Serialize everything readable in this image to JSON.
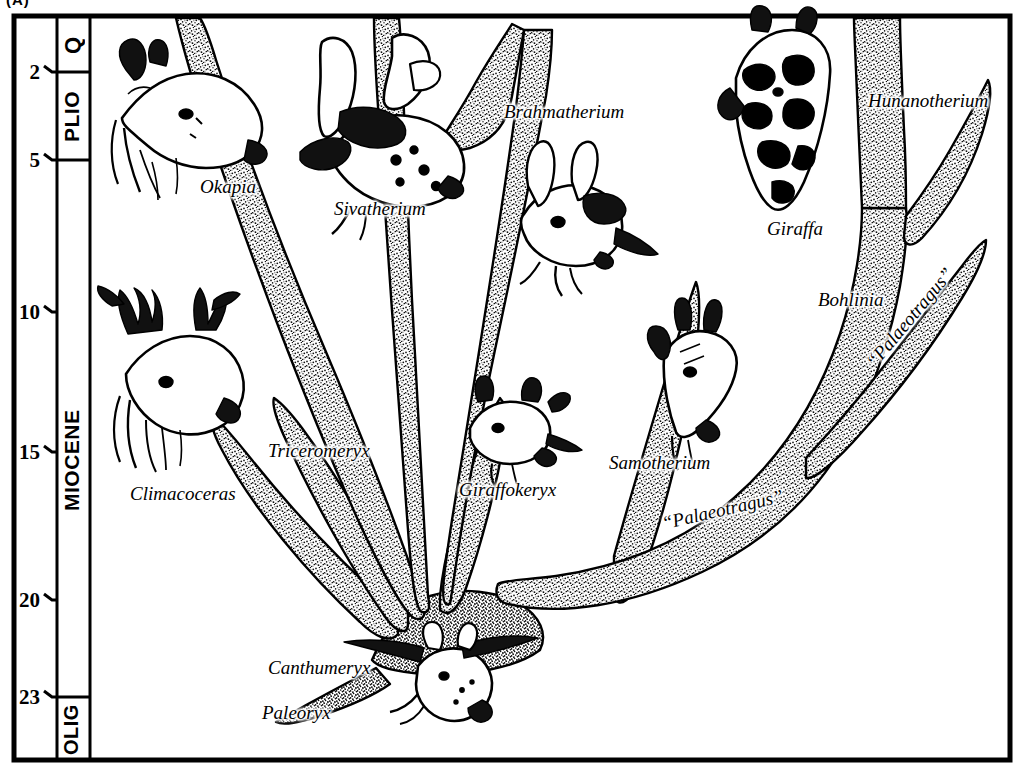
{
  "figure": {
    "caption": "(A)",
    "kind": "phylogenetic-tree"
  },
  "time_scale": {
    "axis_unit": "Ma",
    "ticks": [
      {
        "label": "2",
        "value": 2
      },
      {
        "label": "5",
        "value": 5
      },
      {
        "label": "10",
        "value": 10
      },
      {
        "label": "15",
        "value": 15
      },
      {
        "label": "20",
        "value": 20
      },
      {
        "label": "23",
        "value": 23
      }
    ],
    "epochs": [
      {
        "label": "Q",
        "from": 0,
        "to": 2
      },
      {
        "label": "PLIO",
        "from": 2,
        "to": 5
      },
      {
        "label": "MIOCENE",
        "from": 5,
        "to": 23
      },
      {
        "label": "OLIG",
        "from": 23,
        "to": 26
      }
    ]
  },
  "taxa": [
    {
      "name": "Okapia",
      "quoted": false
    },
    {
      "name": "Sivatherium",
      "quoted": false
    },
    {
      "name": "Brahmatherium",
      "quoted": false
    },
    {
      "name": "Hunanotherium",
      "quoted": false
    },
    {
      "name": "Giraffa",
      "quoted": false
    },
    {
      "name": "Bohlinia",
      "quoted": false
    },
    {
      "name": "“Palaeotragus”",
      "quoted": true
    },
    {
      "name": "Climacoceras",
      "quoted": false
    },
    {
      "name": "Triceromeryx",
      "quoted": false
    },
    {
      "name": "Giraffokeryx",
      "quoted": false
    },
    {
      "name": "Samotherium",
      "quoted": false
    },
    {
      "name": "“Palaeotragus”",
      "quoted": true
    },
    {
      "name": "Canthumeryx",
      "quoted": false
    },
    {
      "name": "Paleoryx",
      "quoted": false
    }
  ],
  "labels": {
    "okapia": "Okapia",
    "sivatherium": "Sivatherium",
    "brahmatherium": "Brahmatherium",
    "hunanotherium": "Hunanotherium",
    "giraffa": "Giraffa",
    "bohlinia": "Bohlinia",
    "palaeotragus_upper": "“Palaeotragus”",
    "palaeotragus_lower": "“Palaeotragus”",
    "climacoceras": "Climacoceras",
    "triceromeryx": "Triceromeryx",
    "giraffokeryx": "Giraffokeryx",
    "samotherium": "Samotherium",
    "canthumeryx": "Canthumeryx",
    "paleoryx": "Paleoryx"
  },
  "colors": {
    "ink": "#000000",
    "paper": "#ffffff",
    "stipple": "#1a1a1a"
  }
}
